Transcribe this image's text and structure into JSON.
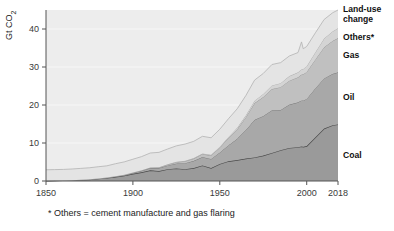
{
  "chart_data": {
    "type": "area",
    "title": "",
    "subtitle": "",
    "xlabel": "",
    "ylabel": "Gt CO2",
    "ylabel_display": "Gt CO₂",
    "xlim": [
      1850,
      2018
    ],
    "ylim": [
      0,
      45
    ],
    "grid": true,
    "stacked": true,
    "legend_position": "right-inline",
    "footnote": "* Others = cement manufacture and gas flaring",
    "xticks": [
      1850,
      1900,
      1950,
      2000,
      2018
    ],
    "xtick_labels": [
      "1850",
      "1900",
      "1950",
      "2000",
      "2018"
    ],
    "yticks": [
      0,
      10,
      20,
      30,
      40
    ],
    "ytick_labels": [
      "0",
      "10",
      "20",
      "30",
      "40"
    ],
    "x": [
      1850,
      1855,
      1860,
      1865,
      1870,
      1875,
      1880,
      1885,
      1890,
      1895,
      1900,
      1905,
      1910,
      1915,
      1920,
      1925,
      1930,
      1935,
      1940,
      1945,
      1950,
      1955,
      1960,
      1965,
      1970,
      1975,
      1980,
      1985,
      1990,
      1995,
      1997,
      1998,
      2000,
      2005,
      2010,
      2015,
      2018
    ],
    "series": [
      {
        "name": "Coal",
        "color": "#9a9a9a",
        "outline": "#4a4a4a",
        "values": [
          0.05,
          0.1,
          0.15,
          0.2,
          0.3,
          0.4,
          0.6,
          0.8,
          1.1,
          1.4,
          1.9,
          2.3,
          2.8,
          2.6,
          3.1,
          3.3,
          3.1,
          3.4,
          4.1,
          3.4,
          4.5,
          5.2,
          5.5,
          5.9,
          6.2,
          6.7,
          7.4,
          8.1,
          8.7,
          8.9,
          9.1,
          9.0,
          9.2,
          11.5,
          13.8,
          14.7,
          14.9
        ]
      },
      {
        "name": "Oil",
        "color": "#a8a8a8",
        "outline": "#6f6f6f",
        "values": [
          0.0,
          0.0,
          0.0,
          0.01,
          0.02,
          0.03,
          0.05,
          0.08,
          0.12,
          0.18,
          0.25,
          0.4,
          0.6,
          0.8,
          1.0,
          1.3,
          1.6,
          1.9,
          2.2,
          2.4,
          3.0,
          4.2,
          5.6,
          7.5,
          9.9,
          10.4,
          11.2,
          10.6,
          11.4,
          11.8,
          12.1,
          12.2,
          12.4,
          12.9,
          13.2,
          13.5,
          13.7
        ]
      },
      {
        "name": "Gas",
        "color": "#c0c0c0",
        "outline": "#8d8d8d",
        "values": [
          0.0,
          0.0,
          0.0,
          0.0,
          0.0,
          0.0,
          0.0,
          0.01,
          0.02,
          0.03,
          0.05,
          0.08,
          0.12,
          0.18,
          0.25,
          0.35,
          0.5,
          0.6,
          0.8,
          0.9,
          1.3,
          1.9,
          2.5,
          3.4,
          4.4,
          5.0,
          5.6,
          6.0,
          6.3,
          6.6,
          6.8,
          6.9,
          7.1,
          7.6,
          8.2,
          8.7,
          9.0
        ]
      },
      {
        "name": "Others*",
        "color": "#d4d4d4",
        "outline": "#a5a5a5",
        "values": [
          0.0,
          0.0,
          0.0,
          0.0,
          0.0,
          0.0,
          0.0,
          0.0,
          0.01,
          0.02,
          0.03,
          0.04,
          0.05,
          0.06,
          0.08,
          0.1,
          0.12,
          0.14,
          0.16,
          0.18,
          0.22,
          0.3,
          0.4,
          0.5,
          0.65,
          0.8,
          0.95,
          1.05,
          1.2,
          1.3,
          1.4,
          1.4,
          1.5,
          1.9,
          2.3,
          2.5,
          2.6
        ]
      },
      {
        "name": "Land-use change",
        "color": "#e4e4e4",
        "outline": "#b3b3b3",
        "values": [
          2.9,
          2.9,
          2.9,
          2.95,
          3.0,
          3.05,
          3.1,
          3.1,
          3.3,
          3.4,
          3.5,
          3.6,
          3.8,
          3.9,
          4.0,
          4.2,
          4.4,
          4.4,
          4.5,
          4.5,
          4.6,
          4.8,
          5.0,
          5.2,
          5.4,
          5.4,
          5.5,
          5.4,
          5.3,
          5.2,
          7.2,
          5.3,
          5.2,
          5.1,
          5.0,
          4.9,
          4.8
        ]
      }
    ],
    "legend_labels": [
      {
        "label": "Land-use change",
        "line1": "Land-use",
        "line2": "change"
      },
      {
        "label": "Others*",
        "line1": "Others*",
        "line2": ""
      },
      {
        "label": "Gas",
        "line1": "Gas",
        "line2": ""
      },
      {
        "label": "Oil",
        "line1": "Oil",
        "line2": ""
      },
      {
        "label": "Coal",
        "line1": "Coal",
        "line2": ""
      }
    ]
  },
  "colors": {
    "plot_background": "#ededed",
    "page_background": "#ffffff",
    "axis": "#555555",
    "grid": "#f7f7f7",
    "text": "#1a1a1a"
  }
}
